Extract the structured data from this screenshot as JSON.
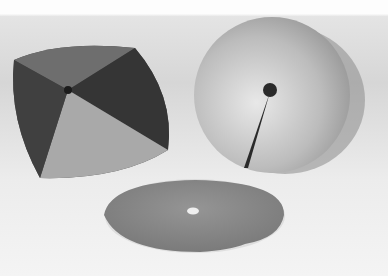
{
  "image": {
    "kind": "black-and-white photograph",
    "description": "Three metal disc objects: a four-faceted folded square plate, a circular disc with a slit from center to edge, and a flat disc with central hole lying on the surface",
    "objects": [
      {
        "name": "folded-square-plate",
        "position": "left"
      },
      {
        "name": "slit-disc",
        "position": "right"
      },
      {
        "name": "flat-disc-with-hole",
        "position": "bottom-center"
      }
    ],
    "colors": {
      "background": "#f2f2f2",
      "backdrop_top": "#fbfbfb",
      "dark_metal": "#3f3f3f",
      "light_metal": "#bdbdbd",
      "flat_disc": "#8a8a8a"
    }
  }
}
